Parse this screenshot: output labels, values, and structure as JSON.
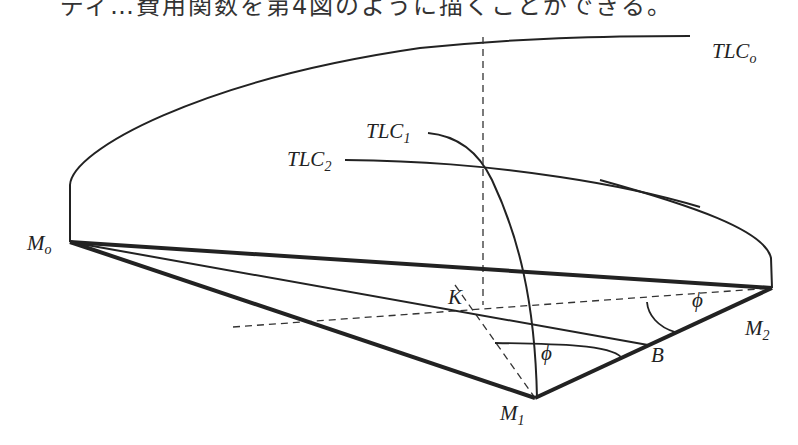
{
  "caption": {
    "text": "ディ…費用関数を第4図のように描くことができる。",
    "clipped": true
  },
  "diagram": {
    "title": "",
    "points": {
      "Mo": {
        "label": "M",
        "sub": "o",
        "x": 70,
        "y": 242
      },
      "M1": {
        "label": "M",
        "sub": "1",
        "x": 535,
        "y": 398
      },
      "M2": {
        "label": "M",
        "sub": "2",
        "x": 772,
        "y": 288
      },
      "K": {
        "label": "K"
      },
      "B": {
        "label": "B"
      }
    },
    "curves": {
      "TLCo": {
        "label": "TLC",
        "sub": "o"
      },
      "TLC1": {
        "label": "TLC",
        "sub": "1"
      },
      "TLC2": {
        "label": "TLC",
        "sub": "2"
      }
    },
    "angles": {
      "phi_m2": {
        "label": "ϕ"
      },
      "phi_m1": {
        "label": "ϕ"
      }
    },
    "colors": {
      "line": "#222222",
      "dashed": "#333333",
      "background": "#ffffff"
    }
  }
}
